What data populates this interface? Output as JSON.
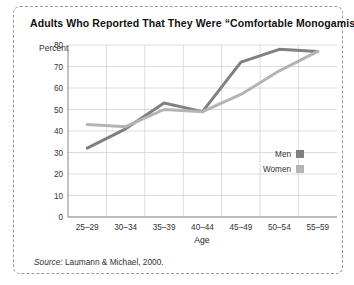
{
  "figure": {
    "title": "Adults Who Reported That They Were “Comfortable Monogamists”",
    "source_lead": "Source:",
    "source_rest": " Laumann & Michael, 2000.",
    "border_color": "#9a9a9a"
  },
  "chart_data": {
    "type": "line",
    "title": "Adults Who Reported That They Were “Comfortable Monogamists”",
    "subtitle": "",
    "xlabel": "Age",
    "ylabel": "Percent",
    "categories": [
      "25–29",
      "30–34",
      "35–39",
      "40–44",
      "45–49",
      "50–54",
      "55–59"
    ],
    "series": [
      {
        "name": "Men",
        "values": [
          32,
          41,
          53,
          49,
          72,
          78,
          77
        ],
        "color": "#808080"
      },
      {
        "name": "Women",
        "values": [
          43,
          42,
          50,
          49,
          57,
          68,
          77
        ],
        "color": "#b4b4b4"
      }
    ],
    "ylim": [
      0,
      80
    ],
    "yticks": [
      0,
      10,
      20,
      30,
      40,
      50,
      60,
      70,
      80
    ],
    "ytick_labels": [
      "0",
      "10",
      "20",
      "30",
      "40",
      "50",
      "60",
      "70",
      "80"
    ],
    "grid": true,
    "grid_color": "#cfcfcf",
    "axis_color": "#888888",
    "legend_position": "inside-right-middle"
  },
  "legend": {
    "items": [
      {
        "label": "Men",
        "swatch_color": "#808080"
      },
      {
        "label": "Women",
        "swatch_color": "#b4b4b4"
      }
    ]
  }
}
